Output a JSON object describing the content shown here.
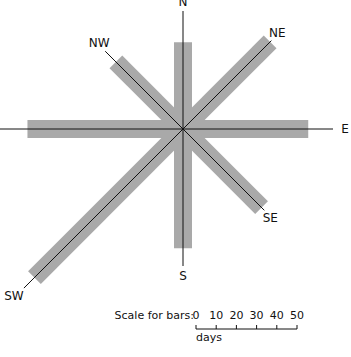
{
  "chart_data": {
    "type": "wind-rose-bar",
    "title": "",
    "unit": "days",
    "center": [
      183,
      129
    ],
    "px_per_day": 2.02,
    "bar_color": "#a9a9a9",
    "line_color": "#111111",
    "directions": [
      {
        "label": "N",
        "angle": 0,
        "days": 43
      },
      {
        "label": "NE",
        "angle": 45,
        "days": 61
      },
      {
        "label": "E",
        "angle": 90,
        "days": 62
      },
      {
        "label": "SE",
        "angle": 135,
        "days": 55
      },
      {
        "label": "S",
        "angle": 180,
        "days": 59
      },
      {
        "label": "SW",
        "angle": 225,
        "days": 104
      },
      {
        "label": "W",
        "angle": 270,
        "days": 77
      },
      {
        "label": "NW",
        "angle": 315,
        "days": 47
      }
    ],
    "scale": {
      "label": "Scale for bars:",
      "ticks": [
        "0",
        "10",
        "20",
        "30",
        "40",
        "50"
      ],
      "unit_label": "days"
    }
  }
}
